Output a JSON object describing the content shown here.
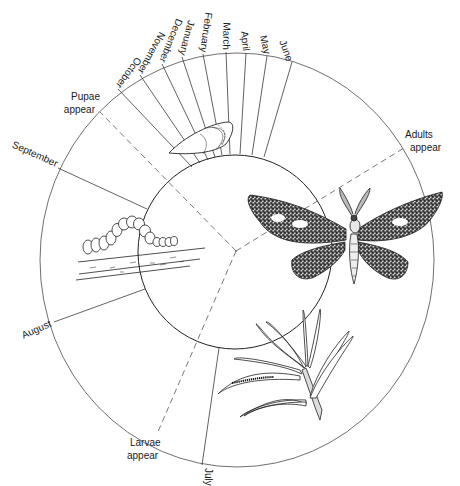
{
  "months": [
    {
      "id": "june",
      "label": "June"
    },
    {
      "id": "may",
      "label": "May"
    },
    {
      "id": "april",
      "label": "April"
    },
    {
      "id": "march",
      "label": "March"
    },
    {
      "id": "february",
      "label": "February"
    },
    {
      "id": "january",
      "label": "January"
    },
    {
      "id": "december",
      "label": "December"
    },
    {
      "id": "november",
      "label": "November"
    },
    {
      "id": "october",
      "label": "October"
    },
    {
      "id": "september",
      "label": "September"
    },
    {
      "id": "august",
      "label": "August"
    },
    {
      "id": "july",
      "label": "July"
    }
  ],
  "stages": [
    {
      "id": "pupae",
      "line1": "Pupae",
      "line2": "appear"
    },
    {
      "id": "adults",
      "line1": "Adults",
      "line2": "appear"
    },
    {
      "id": "larvae",
      "line1": "Larvae",
      "line2": "appear"
    }
  ],
  "illustrations": [
    {
      "id": "pupa",
      "label": "pupa-illustration"
    },
    {
      "id": "moth",
      "label": "adult-moth-illustration"
    },
    {
      "id": "caterpillar",
      "label": "caterpillar-on-twig-illustration"
    },
    {
      "id": "larva-on-pine",
      "label": "larva-on-pine-needles-illustration"
    }
  ],
  "colors": {
    "line": "#3a3a3a",
    "ink": "#1a1a1a",
    "background": "#ffffff"
  }
}
